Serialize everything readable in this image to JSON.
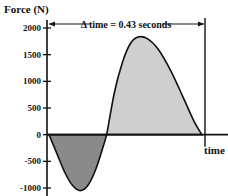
{
  "chart_data": {
    "type": "area",
    "title": "",
    "ylabel": "Force (N)",
    "xlabel": "time",
    "ylim": [
      -1000,
      2000
    ],
    "yticks": [
      2000,
      1500,
      1000,
      500,
      0,
      -500,
      -1000
    ],
    "ytick_labels": [
      "2000",
      "1500",
      "1000",
      "500",
      "0",
      "-500",
      "-1000"
    ],
    "grid": false,
    "annotation": "Δ time = 0.43 seconds",
    "duration_seconds": 0.43,
    "series": [
      {
        "name": "negative impulse",
        "fill": "#8a8a8a",
        "t_fraction": [
          0.0,
          0.1,
          0.2,
          0.3,
          0.35,
          0.4,
          0.5,
          0.6,
          0.7,
          0.8,
          0.9,
          1.0
        ],
        "start": 0.0,
        "end": 0.37,
        "points": [
          [
            0.0,
            0
          ],
          [
            0.05,
            -350
          ],
          [
            0.1,
            -700
          ],
          [
            0.15,
            -950
          ],
          [
            0.2,
            -1050
          ],
          [
            0.25,
            -950
          ],
          [
            0.3,
            -650
          ],
          [
            0.35,
            -200
          ],
          [
            0.37,
            0
          ]
        ]
      },
      {
        "name": "positive impulse",
        "fill": "#cfcfcf",
        "points": [
          [
            0.37,
            0
          ],
          [
            0.42,
            800
          ],
          [
            0.47,
            1350
          ],
          [
            0.52,
            1700
          ],
          [
            0.57,
            1830
          ],
          [
            0.63,
            1800
          ],
          [
            0.7,
            1600
          ],
          [
            0.78,
            1200
          ],
          [
            0.86,
            700
          ],
          [
            0.93,
            250
          ],
          [
            0.98,
            0
          ]
        ]
      }
    ]
  }
}
